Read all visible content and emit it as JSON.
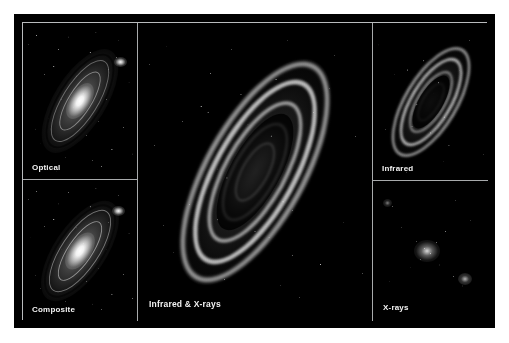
{
  "figure": {
    "background_color": "#ffffff",
    "frame_color": "#000000",
    "divider_color": "#a8aaac",
    "label_color": "#f2f2f2"
  },
  "panels": [
    {
      "id": "optical",
      "label": "Optical",
      "position": "top-left",
      "description": "Inclined spiral galaxy with bright white nucleus, smooth grey disc, dark dust lanes and a small companion galaxy at upper right; dense foreground starfield."
    },
    {
      "id": "composite",
      "label": "Composite",
      "position": "bottom-left",
      "description": "Combined multiwavelength view resembling the optical image with a bright core, spiral arms and companion galaxy at upper right."
    },
    {
      "id": "infrared-xrays",
      "label": "Infrared & X-rays",
      "position": "center",
      "description": "Large central view showing bright knotted infrared dust rings forming a tilted ellipse with a darker interior, overlaid with scattered X-ray point sources."
    },
    {
      "id": "infrared",
      "label": "Infrared",
      "position": "top-right",
      "description": "Tilted elliptical dust rings glowing brightly with a dark nuclear gap at the centre."
    },
    {
      "id": "x-rays",
      "label": "X-rays",
      "position": "bottom-right",
      "description": "Mostly dark field with sparse bright X-ray point sources concentrated toward a diffuse core and one offset source at lower right."
    }
  ]
}
